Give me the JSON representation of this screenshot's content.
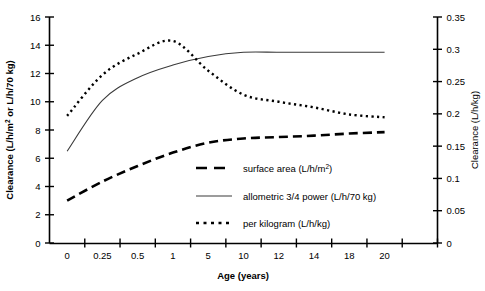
{
  "chart_data": {
    "type": "line",
    "title": "",
    "xlabel": "Age (years)",
    "ylabel": "Clearance (L/h/m² or L/h/70 kg)",
    "ylabel_right": "Clearance (L/h/kg)",
    "categories": [
      "0",
      "0.25",
      "0.5",
      "1",
      "5",
      "10",
      "12",
      "14",
      "18",
      "20"
    ],
    "x_axis_kind": "categorical-unevenly-spaced",
    "ylim": [
      0,
      16
    ],
    "yticks": [
      0,
      2,
      4,
      6,
      8,
      10,
      12,
      14,
      16
    ],
    "ylim_right": [
      0,
      0.35
    ],
    "yticks_right": [
      "0",
      "0.05",
      "0.1",
      "0.15",
      "0.2",
      "0.25",
      "0.3",
      "0.35"
    ],
    "grid": false,
    "legend_position": "center-right-inside",
    "series": [
      {
        "name": "surface area (L/h/m²)",
        "style": "dashed",
        "axis": "left",
        "values": [
          3.0,
          4.35,
          5.45,
          6.4,
          7.1,
          7.4,
          7.5,
          7.6,
          7.75,
          7.85
        ]
      },
      {
        "name": "allometric 3/4 power (L/h/70 kg)",
        "style": "solid",
        "axis": "left",
        "values": [
          6.5,
          10.1,
          11.7,
          12.6,
          13.2,
          13.5,
          13.5,
          13.5,
          13.5,
          13.5
        ]
      },
      {
        "name": "per kilogram (L/h/kg)",
        "style": "dotted",
        "axis": "right",
        "values_left_scale": [
          9.0,
          11.9,
          13.4,
          14.3,
          12.2,
          10.5,
          10.0,
          9.6,
          9.1,
          8.9
        ],
        "values": [
          0.196,
          0.26,
          0.293,
          0.313,
          0.267,
          0.23,
          0.219,
          0.21,
          0.199,
          0.195
        ]
      }
    ],
    "annotations": [
      "per kilogram curve peaks just after age 1 then declines steeply",
      "allometric 3/4 power curve plateaus at ~13.5 from about age 5 onward"
    ]
  },
  "legend": {
    "items": [
      {
        "label_pre": "surface area (L/h/m",
        "sup": "2",
        "label_post": ")",
        "style": "dashed"
      },
      {
        "label_pre": "allometric 3/4 power (L/h/70 kg)",
        "sup": "",
        "label_post": "",
        "style": "solid"
      },
      {
        "label_pre": "per kilogram (L/h/kg)",
        "sup": "",
        "label_post": "",
        "style": "dotted"
      }
    ]
  },
  "axes": {
    "left_title_pre": "Clearance (L/h/m",
    "left_title_sup": "2",
    "left_title_post": " or L/h/70 kg)",
    "right_title": "Clearance (L/h/kg)",
    "x_title": "Age (years)"
  },
  "colors": {
    "ink": "#000000",
    "background": "#ffffff",
    "solid_line": "#3a3a3a"
  }
}
